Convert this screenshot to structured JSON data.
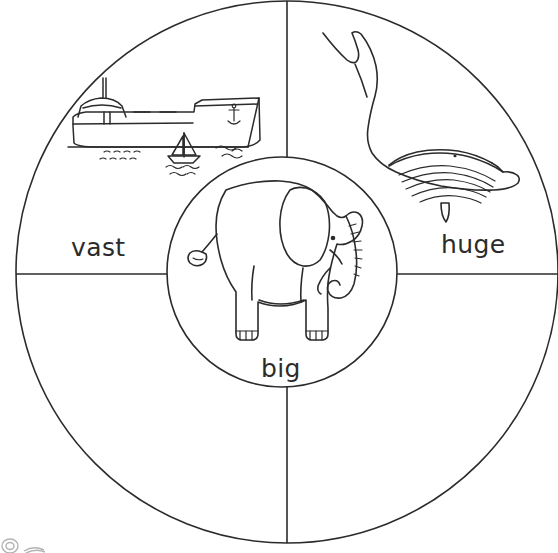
{
  "page": {
    "kind": "word-wheel-worksheet",
    "background_color": "#ffffff",
    "ink_color": "#2b2b2b",
    "width": 558,
    "height": 553
  },
  "wheel": {
    "outer_circle": {
      "cx": 287,
      "cy": 272,
      "r": 271
    },
    "inner_circle": {
      "cx": 282,
      "cy": 272,
      "r": 115
    },
    "dividers": [
      {
        "name": "vertical-divider",
        "x1": 287,
        "y1": 1,
        "x2": 287,
        "y2": 543
      },
      {
        "name": "horizontal-divider",
        "x1": 16,
        "y1": 274,
        "x2": 558,
        "y2": 274
      }
    ]
  },
  "segments": [
    {
      "id": "vast",
      "label": "vast",
      "illustration": "cargo-ship-and-sailboat",
      "position": "upper-left"
    },
    {
      "id": "huge",
      "label": "huge",
      "illustration": "whale",
      "position": "upper-right"
    },
    {
      "id": "big",
      "label": "big",
      "illustration": "elephant",
      "position": "center"
    }
  ],
  "watermark": {
    "name": "corner-watermark",
    "description": "faint partial logo mark at bottom-left edge"
  }
}
